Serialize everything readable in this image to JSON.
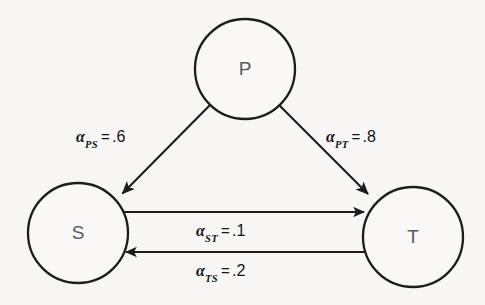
{
  "diagram": {
    "background_color": "#f7f6f5",
    "stroke_color": "#1d1d1d",
    "node_label_color": "#5a5a5a",
    "nodes": [
      {
        "id": "P",
        "label": "P",
        "cx": 245,
        "cy": 69,
        "r": 50
      },
      {
        "id": "S",
        "label": "S",
        "cx": 78,
        "cy": 233,
        "r": 50
      },
      {
        "id": "T",
        "label": "T",
        "cx": 413,
        "cy": 237,
        "r": 50
      }
    ],
    "edges": [
      {
        "id": "PS",
        "from": "P",
        "to": "S",
        "symbol": "α",
        "subscript": "PS",
        "equals": "=",
        "value": ".6",
        "text": "αPS = .6"
      },
      {
        "id": "PT",
        "from": "P",
        "to": "T",
        "symbol": "α",
        "subscript": "PT",
        "equals": "=",
        "value": ".8",
        "text": "αPT = .8"
      },
      {
        "id": "ST",
        "from": "S",
        "to": "T",
        "symbol": "α",
        "subscript": "ST",
        "equals": "=",
        "value": ".1",
        "text": "αST = .1"
      },
      {
        "id": "TS",
        "from": "T",
        "to": "S",
        "symbol": "α",
        "subscript": "TS",
        "equals": "=",
        "value": ".2",
        "text": "αTS = .2"
      }
    ]
  }
}
